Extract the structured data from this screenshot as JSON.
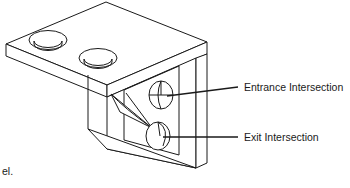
{
  "figure": {
    "kind": "isometric-technical-drawing",
    "background_color": "#ffffff",
    "line_color": "#1a1a1a"
  },
  "callouts": [
    {
      "id": "entrance",
      "label": "Entrance Intersection",
      "label_x": 244,
      "label_y": 88,
      "leader_from_x": 167,
      "leader_from_y": 96,
      "leader_to_x": 238,
      "leader_to_y": 87
    },
    {
      "id": "exit",
      "label": "Exit Intersection",
      "label_x": 244,
      "label_y": 138,
      "leader_from_x": 163,
      "leader_from_y": 137,
      "leader_to_x": 238,
      "leader_to_y": 137
    }
  ],
  "caption": {
    "fragment": "el.",
    "x": 2,
    "y": 172
  },
  "top_plate": {
    "holes": [
      {
        "id": "counterbore-1",
        "cx": 48,
        "cy": 40,
        "rx": 19,
        "ry": 9.5,
        "inner_rx": 14,
        "inner_ry": 6.5
      },
      {
        "id": "counterbore-2",
        "cx": 98,
        "cy": 58,
        "rx": 19,
        "ry": 9.5,
        "inner_rx": 14,
        "inner_ry": 6.5
      }
    ]
  },
  "vertical_face": {
    "holes": [
      {
        "id": "entrance-hole",
        "cx": 161,
        "cy": 95,
        "rx": 12,
        "ry": 14
      },
      {
        "id": "exit-hole",
        "cx": 158,
        "cy": 136,
        "rx": 12,
        "ry": 14
      }
    ]
  }
}
